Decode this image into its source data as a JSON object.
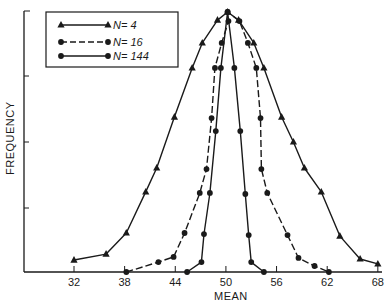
{
  "chart_data": {
    "type": "line",
    "title": "",
    "xlabel": "MEAN",
    "ylabel": "FREQUENCY",
    "xlim": [
      26,
      68
    ],
    "ylim": [
      0,
      100
    ],
    "x_ticks": [
      32,
      38,
      44,
      50,
      56,
      62,
      68
    ],
    "y_ticks_count": 4,
    "y_tick_labels_shown": false,
    "grid": false,
    "legend_position": "upper left",
    "colors": {
      "ink": "#1a1a1a",
      "background": "#ffffff"
    },
    "series": [
      {
        "name": "N= 4",
        "marker": "triangle",
        "line_style": "solid",
        "points": [
          [
            32,
            4.6
          ],
          [
            35.8,
            6.9
          ],
          [
            38.2,
            15.0
          ],
          [
            40.5,
            30.8
          ],
          [
            41.8,
            40.0
          ],
          [
            43.9,
            59.6
          ],
          [
            46.0,
            78.5
          ],
          [
            47.2,
            88.1
          ],
          [
            49.0,
            96.9
          ],
          [
            50.2,
            100
          ],
          [
            51.5,
            96.9
          ],
          [
            53.3,
            88.1
          ],
          [
            54.5,
            78.5
          ],
          [
            56.6,
            59.6
          ],
          [
            58.0,
            50.0
          ],
          [
            59.3,
            40.0
          ],
          [
            61.3,
            30.8
          ],
          [
            63.5,
            13.8
          ],
          [
            65.9,
            5.0
          ],
          [
            68,
            3.1
          ]
        ]
      },
      {
        "name": "N= 16",
        "marker": "circle",
        "line_style": "dashed",
        "points": [
          [
            38.2,
            0.0
          ],
          [
            42.0,
            3.8
          ],
          [
            43.8,
            5.8
          ],
          [
            45.1,
            15.0
          ],
          [
            46.9,
            30.4
          ],
          [
            47.7,
            39.6
          ],
          [
            48.3,
            59.2
          ],
          [
            48.7,
            78.5
          ],
          [
            49.5,
            88.1
          ],
          [
            50.3,
            96.5
          ],
          [
            50.2,
            100
          ],
          [
            51.6,
            96.5
          ],
          [
            52.6,
            88.1
          ],
          [
            53.6,
            78.5
          ],
          [
            54.1,
            59.2
          ],
          [
            54.2,
            39.6
          ],
          [
            54.9,
            30.4
          ],
          [
            57.3,
            14.2
          ],
          [
            58.6,
            5.4
          ],
          [
            60.5,
            2.3
          ],
          [
            62.2,
            0.0
          ]
        ]
      },
      {
        "name": "N= 144",
        "marker": "circle",
        "line_style": "solid",
        "points": [
          [
            45.4,
            0.0
          ],
          [
            47.1,
            3.8
          ],
          [
            47.4,
            14.6
          ],
          [
            48.1,
            30.4
          ],
          [
            48.8,
            54.2
          ],
          [
            49.4,
            78.5
          ],
          [
            50.2,
            100
          ],
          [
            51.0,
            78.5
          ],
          [
            51.7,
            54.2
          ],
          [
            52.3,
            30.0
          ],
          [
            52.7,
            14.2
          ],
          [
            53.0,
            3.8
          ],
          [
            54.5,
            0.0
          ]
        ]
      }
    ]
  },
  "legend": {
    "items": [
      {
        "label": "N= 4"
      },
      {
        "label": "N= 16"
      },
      {
        "label": "N= 144"
      }
    ]
  },
  "axes": {
    "xlabel": "MEAN",
    "ylabel": "FREQUENCY",
    "x_tick_labels": [
      "32",
      "38",
      "44",
      "50",
      "56",
      "62",
      "68"
    ]
  }
}
